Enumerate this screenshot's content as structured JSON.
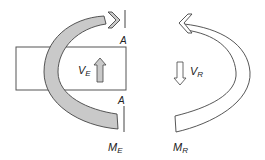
{
  "diagram": {
    "left_panel": {
      "section_label_top": "A",
      "section_label_bottom": "A",
      "shear_label": "V",
      "shear_subscript": "E",
      "moment_label": "M",
      "moment_subscript": "E",
      "moment_fill_color": "#c9c9c9",
      "shear_arrow_direction": "up"
    },
    "right_panel": {
      "shear_label": "V",
      "shear_subscript": "R",
      "moment_label": "M",
      "moment_subscript": "R",
      "moment_fill_color": "#ffffff",
      "shear_arrow_direction": "down"
    },
    "stroke_color": "#444444"
  }
}
